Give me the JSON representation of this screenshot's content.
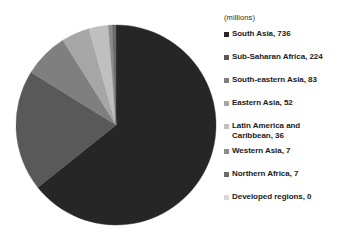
{
  "chart_data": {
    "type": "pie",
    "title": "",
    "units_note": "(millions)",
    "legend_position": "right",
    "start_angle_deg": 0,
    "direction": "clockwise",
    "total": 1145,
    "categories": [
      "South Asia",
      "Sub-Saharan Africa",
      "South-eastern Asia",
      "Eastern Asia",
      "Latin America and Caribbean",
      "Western Asia",
      "Northern Africa",
      "Developed regions"
    ],
    "values": [
      736,
      224,
      83,
      52,
      36,
      7,
      7,
      0
    ],
    "colors": [
      "#262626",
      "#595959",
      "#7f7f7f",
      "#a6a6a6",
      "#bfbfbf",
      "#8c8c8c",
      "#6b6b6b",
      "#d9d9d9"
    ],
    "slices": [
      {
        "label": "South Asia",
        "value": 736,
        "color": "#262626"
      },
      {
        "label": "Sub-Saharan Africa",
        "value": 224,
        "color": "#595959"
      },
      {
        "label": "South-eastern Asia",
        "value": 83,
        "color": "#7f7f7f"
      },
      {
        "label": "Eastern Asia",
        "value": 52,
        "color": "#a6a6a6"
      },
      {
        "label": "Latin America and Caribbean",
        "value": 36,
        "color": "#bfbfbf"
      },
      {
        "label": "Western Asia",
        "value": 7,
        "color": "#8c8c8c"
      },
      {
        "label": "Northern Africa",
        "value": 7,
        "color": "#6b6b6b"
      },
      {
        "label": "Developed regions",
        "value": 0,
        "color": "#d9d9d9"
      }
    ]
  },
  "legend": {
    "units": "(millions)",
    "entries": [
      {
        "text": "South Asia, 736",
        "color": "#262626"
      },
      {
        "text": "Sub-Saharan Africa, 224",
        "color": "#595959"
      },
      {
        "text": "South-eastern Asia, 83",
        "color": "#7f7f7f"
      },
      {
        "text": "Eastern Asia, 52",
        "color": "#a6a6a6"
      },
      {
        "text": "Latin America and\nCaribbean, 36",
        "color": "#bfbfbf"
      },
      {
        "text": "Western Asia, 7",
        "color": "#8c8c8c"
      },
      {
        "text": "Northern Africa, 7",
        "color": "#6b6b6b"
      },
      {
        "text": "Developed regions, 0",
        "color": "#d9d9d9"
      }
    ]
  },
  "geometry": {
    "center_x": 116,
    "center_y": 125,
    "radius": 100
  }
}
